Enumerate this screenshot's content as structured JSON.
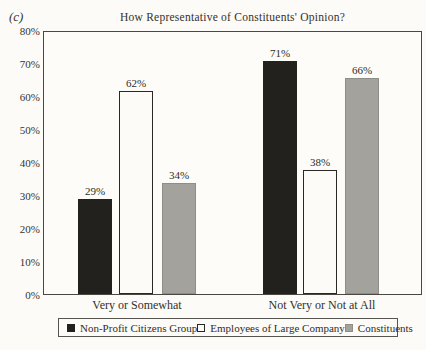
{
  "figure": {
    "panel_label": "(c)"
  },
  "chart_data": {
    "type": "bar",
    "title": "How Representative of Constituents' Opinion?",
    "categories": [
      "Very or Somewhat",
      "Not Very or Not at All"
    ],
    "series": [
      {
        "name": "Non-Profit Citizens Group",
        "values": [
          29,
          71
        ],
        "color": "#22211e"
      },
      {
        "name": "Employees of Large Company",
        "values": [
          62,
          38
        ],
        "color": "#fcfbf7"
      },
      {
        "name": "Constituents",
        "values": [
          34,
          66
        ],
        "color": "#a4a29d"
      }
    ],
    "value_labels": [
      [
        "29%",
        "71%"
      ],
      [
        "62%",
        "38%"
      ],
      [
        "34%",
        "66%"
      ]
    ],
    "value_suffix": "%",
    "xlabel": "",
    "ylabel": "",
    "ylim": [
      0,
      80
    ],
    "yticks": [
      "0%",
      "10%",
      "20%",
      "30%",
      "40%",
      "50%",
      "60%",
      "70%",
      "80%"
    ],
    "grid": false,
    "legend_position": "bottom",
    "colors": {
      "frame": "#4a4843",
      "text": "#33312c",
      "background": "#fcfbf8"
    }
  }
}
